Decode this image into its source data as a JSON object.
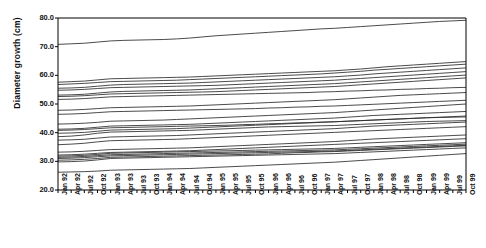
{
  "chart_data": {
    "type": "line",
    "title": "",
    "xlabel": "",
    "ylabel": "Diameter growth (cm)",
    "ylim": [
      20.0,
      80.0
    ],
    "yticks": [
      "20.0",
      "30.0",
      "40.0",
      "50.0",
      "60.0",
      "70.0",
      "80.0"
    ],
    "ytick_values": [
      20.0,
      30.0,
      40.0,
      50.0,
      60.0,
      70.0,
      80.0
    ],
    "grid": false,
    "legend": "none",
    "x": [
      "Jan 92",
      "Apr 92",
      "Jul 92",
      "Oct 92",
      "Jan 93",
      "Apr 93",
      "Jul 93",
      "Oct 93",
      "Jan 94",
      "Apr 94",
      "Jul 94",
      "Oct 94",
      "Jan 95",
      "Apr 95",
      "Jul 95",
      "Oct 95",
      "Jan 96",
      "Apr 96",
      "Jul 96",
      "Oct 96",
      "Jan 97",
      "Apr 97",
      "Jul 97",
      "Oct 97",
      "Jan 98",
      "Apr 98",
      "Jul 98",
      "Oct 98",
      "Jan 99",
      "Apr 99",
      "Jul 99",
      "Oct 99"
    ],
    "series": [
      {
        "name": "tree-01",
        "values": [
          70.8,
          71.0,
          71.2,
          71.6,
          72.0,
          72.2,
          72.3,
          72.4,
          72.5,
          72.7,
          73.0,
          73.4,
          73.8,
          74.1,
          74.4,
          74.7,
          75.0,
          75.3,
          75.6,
          75.9,
          76.2,
          76.4,
          76.7,
          77.0,
          77.3,
          77.6,
          77.9,
          78.2,
          78.5,
          78.8,
          79.0,
          79.2
        ]
      },
      {
        "name": "tree-02",
        "values": [
          57.6,
          57.8,
          58.0,
          58.4,
          58.8,
          58.9,
          59.0,
          59.1,
          59.2,
          59.3,
          59.4,
          59.6,
          59.8,
          60.0,
          60.2,
          60.4,
          60.6,
          60.8,
          61.0,
          61.2,
          61.4,
          61.6,
          61.9,
          62.2,
          62.6,
          63.0,
          63.3,
          63.6,
          63.9,
          64.2,
          64.5,
          64.8
        ]
      },
      {
        "name": "tree-03",
        "values": [
          56.8,
          57.0,
          57.2,
          57.5,
          57.8,
          57.9,
          58.0,
          58.1,
          58.2,
          58.3,
          58.5,
          58.7,
          58.9,
          59.1,
          59.3,
          59.5,
          59.7,
          59.9,
          60.1,
          60.3,
          60.5,
          60.8,
          61.1,
          61.4,
          61.8,
          62.1,
          62.4,
          62.7,
          63.0,
          63.3,
          63.6,
          63.9
        ]
      },
      {
        "name": "tree-04",
        "values": [
          55.5,
          55.6,
          55.8,
          56.2,
          56.6,
          56.8,
          56.9,
          57.0,
          57.1,
          57.2,
          57.3,
          57.5,
          57.7,
          57.9,
          58.1,
          58.3,
          58.5,
          58.7,
          58.9,
          59.1,
          59.3,
          59.5,
          59.8,
          60.1,
          60.5,
          60.8,
          61.1,
          61.4,
          61.7,
          62.0,
          62.3,
          62.6
        ]
      },
      {
        "name": "tree-05",
        "values": [
          54.8,
          54.9,
          55.1,
          55.4,
          55.7,
          55.8,
          55.9,
          56.0,
          56.1,
          56.2,
          56.3,
          56.4,
          56.5,
          56.7,
          56.9,
          57.1,
          57.3,
          57.5,
          57.7,
          57.9,
          58.1,
          58.3,
          58.6,
          58.9,
          59.2,
          59.5,
          59.8,
          60.1,
          60.4,
          60.7,
          61.0,
          61.3
        ]
      },
      {
        "name": "tree-06",
        "values": [
          53.1,
          53.2,
          53.4,
          53.8,
          54.2,
          54.4,
          54.5,
          54.6,
          54.7,
          54.8,
          54.9,
          55.1,
          55.3,
          55.5,
          55.7,
          55.9,
          56.1,
          56.3,
          56.5,
          56.7,
          56.9,
          57.1,
          57.4,
          57.7,
          58.0,
          58.3,
          58.6,
          58.9,
          59.2,
          59.5,
          59.8,
          60.1
        ]
      },
      {
        "name": "tree-07",
        "values": [
          52.6,
          52.7,
          52.9,
          53.2,
          53.5,
          53.6,
          53.7,
          53.8,
          53.9,
          54.0,
          54.1,
          54.2,
          54.3,
          54.5,
          54.7,
          54.9,
          55.1,
          55.3,
          55.5,
          55.7,
          55.9,
          56.1,
          56.4,
          56.7,
          57.0,
          57.3,
          57.6,
          57.9,
          58.2,
          58.5,
          58.8,
          59.1
        ]
      },
      {
        "name": "tree-08",
        "values": [
          51.6,
          51.7,
          51.9,
          52.2,
          52.5,
          52.6,
          52.7,
          52.8,
          52.9,
          53.0,
          53.1,
          53.2,
          53.3,
          53.4,
          53.5,
          53.6,
          53.7,
          53.8,
          53.9,
          54.0,
          54.2,
          54.3,
          54.5,
          54.6,
          54.8,
          54.9,
          55.1,
          55.2,
          55.4,
          55.5,
          55.7,
          55.8
        ]
      },
      {
        "name": "tree-09",
        "values": [
          47.8,
          47.9,
          48.1,
          48.4,
          48.7,
          48.8,
          48.9,
          49.0,
          49.1,
          49.2,
          49.3,
          49.5,
          49.7,
          49.9,
          50.1,
          50.3,
          50.5,
          50.7,
          50.9,
          51.1,
          51.3,
          51.5,
          51.8,
          52.1,
          52.4,
          52.7,
          53.0,
          53.2,
          53.4,
          53.6,
          53.8,
          54.0
        ]
      },
      {
        "name": "tree-10",
        "values": [
          46.4,
          46.5,
          46.7,
          47.0,
          47.3,
          47.4,
          47.5,
          47.6,
          47.7,
          47.8,
          47.9,
          48.0,
          48.1,
          48.2,
          48.3,
          48.4,
          48.6,
          48.7,
          48.9,
          49.0,
          49.2,
          49.3,
          49.5,
          49.7,
          49.9,
          50.1,
          50.3,
          50.5,
          50.7,
          50.9,
          51.1,
          51.3
        ]
      },
      {
        "name": "tree-11",
        "values": [
          43.0,
          43.1,
          43.3,
          43.6,
          44.0,
          44.1,
          44.2,
          44.3,
          44.4,
          44.6,
          44.8,
          45.0,
          45.2,
          45.4,
          45.6,
          45.8,
          46.0,
          46.2,
          46.4,
          46.6,
          46.8,
          47.0,
          47.3,
          47.6,
          47.9,
          48.2,
          48.5,
          48.8,
          49.1,
          49.4,
          49.7,
          50.0
        ]
      },
      {
        "name": "tree-12",
        "values": [
          41.2,
          41.3,
          41.5,
          41.9,
          42.3,
          42.4,
          42.5,
          42.6,
          42.7,
          42.8,
          42.9,
          43.1,
          43.3,
          43.5,
          43.7,
          43.9,
          44.1,
          44.3,
          44.5,
          44.7,
          44.9,
          45.1,
          45.4,
          45.7,
          46.0,
          46.2,
          46.4,
          46.6,
          46.8,
          47.0,
          47.2,
          47.4
        ]
      },
      {
        "name": "tree-13",
        "values": [
          40.8,
          40.9,
          41.1,
          41.4,
          41.7,
          41.8,
          41.9,
          42.0,
          42.1,
          42.2,
          42.3,
          42.4,
          42.5,
          42.6,
          42.8,
          42.9,
          43.1,
          43.2,
          43.4,
          43.5,
          43.7,
          43.8,
          44.0,
          44.2,
          44.4,
          44.6,
          44.8,
          45.0,
          45.2,
          45.4,
          45.6,
          45.8
        ]
      },
      {
        "name": "tree-14",
        "values": [
          39.8,
          39.9,
          40.1,
          40.5,
          40.9,
          41.0,
          41.1,
          41.2,
          41.3,
          41.4,
          41.6,
          41.8,
          42.0,
          42.2,
          42.4,
          42.6,
          42.8,
          43.0,
          43.2,
          43.4,
          43.6,
          43.8,
          44.0,
          44.2,
          44.4,
          44.6,
          44.8,
          45.0,
          45.2,
          45.3,
          45.4,
          45.5
        ]
      },
      {
        "name": "tree-15",
        "values": [
          38.6,
          38.8,
          39.2,
          39.8,
          40.2,
          40.3,
          40.4,
          40.5,
          40.6,
          40.7,
          40.8,
          41.0,
          41.2,
          41.4,
          41.6,
          41.8,
          42.0,
          42.1,
          42.2,
          42.3,
          42.4,
          42.5,
          42.7,
          42.9,
          43.1,
          43.3,
          43.5,
          43.7,
          43.9,
          44.0,
          44.1,
          44.2
        ]
      },
      {
        "name": "tree-16",
        "values": [
          37.4,
          37.5,
          37.7,
          38.1,
          38.5,
          38.6,
          38.7,
          38.8,
          38.9,
          39.0,
          39.2,
          39.4,
          39.6,
          39.8,
          40.0,
          40.2,
          40.4,
          40.6,
          40.8,
          41.0,
          41.2,
          41.4,
          41.7,
          42.0,
          42.3,
          42.5,
          42.7,
          42.9,
          43.1,
          43.3,
          43.5,
          43.7
        ]
      },
      {
        "name": "tree-17",
        "values": [
          35.8,
          36.0,
          36.3,
          36.8,
          37.2,
          37.3,
          37.4,
          37.5,
          37.6,
          37.7,
          37.9,
          38.1,
          38.3,
          38.5,
          38.7,
          38.9,
          39.1,
          39.3,
          39.5,
          39.7,
          39.9,
          40.1,
          40.3,
          40.5,
          40.7,
          40.9,
          41.1,
          41.3,
          41.5,
          41.7,
          41.9,
          42.1
        ]
      },
      {
        "name": "tree-18",
        "values": [
          33.2,
          33.3,
          33.5,
          33.8,
          34.1,
          34.2,
          34.3,
          34.4,
          34.5,
          34.6,
          34.7,
          34.9,
          35.1,
          35.3,
          35.5,
          35.7,
          35.9,
          36.1,
          36.3,
          36.5,
          36.7,
          36.9,
          37.2,
          37.5,
          37.8,
          38.0,
          38.2,
          38.4,
          38.6,
          38.8,
          39.0,
          39.2
        ]
      },
      {
        "name": "tree-19",
        "values": [
          32.2,
          32.3,
          32.5,
          32.8,
          33.1,
          33.2,
          33.3,
          33.4,
          33.5,
          33.6,
          33.7,
          33.9,
          34.1,
          34.3,
          34.5,
          34.7,
          34.9,
          35.1,
          35.3,
          35.5,
          35.7,
          35.9,
          36.1,
          36.3,
          36.5,
          36.7,
          36.9,
          37.1,
          37.3,
          37.5,
          37.7,
          37.9
        ]
      },
      {
        "name": "tree-20",
        "values": [
          31.8,
          31.9,
          32.1,
          32.4,
          32.8,
          32.9,
          33.0,
          33.1,
          33.2,
          33.3,
          33.4,
          33.5,
          33.6,
          33.7,
          33.8,
          33.9,
          34.0,
          34.1,
          34.2,
          34.3,
          34.4,
          34.5,
          34.7,
          34.9,
          35.1,
          35.3,
          35.5,
          35.7,
          35.9,
          36.1,
          36.3,
          36.5
        ]
      },
      {
        "name": "tree-21",
        "values": [
          31.4,
          31.5,
          31.7,
          32.0,
          32.3,
          32.4,
          32.5,
          32.6,
          32.7,
          32.8,
          32.9,
          33.0,
          33.1,
          33.2,
          33.3,
          33.4,
          33.5,
          33.6,
          33.7,
          33.8,
          33.9,
          34.0,
          34.2,
          34.4,
          34.6,
          34.8,
          35.0,
          35.2,
          35.4,
          35.6,
          35.8,
          36.0
        ]
      },
      {
        "name": "tree-22",
        "values": [
          31.0,
          31.1,
          31.3,
          31.6,
          31.9,
          32.0,
          32.1,
          32.2,
          32.3,
          32.4,
          32.5,
          32.6,
          32.7,
          32.8,
          32.9,
          33.0,
          33.1,
          33.2,
          33.3,
          33.4,
          33.5,
          33.6,
          33.8,
          34.0,
          34.2,
          34.4,
          34.6,
          34.8,
          35.0,
          35.2,
          35.4,
          35.6
        ]
      },
      {
        "name": "tree-23",
        "values": [
          30.4,
          30.5,
          30.7,
          31.0,
          31.4,
          31.5,
          31.6,
          31.7,
          31.8,
          31.9,
          32.0,
          32.1,
          32.2,
          32.3,
          32.4,
          32.5,
          32.6,
          32.8,
          33.0,
          33.1,
          33.3,
          33.4,
          33.6,
          33.8,
          34.0,
          34.2,
          34.4,
          34.6,
          34.8,
          35.0,
          35.2,
          35.4
        ]
      },
      {
        "name": "tree-24",
        "values": [
          29.8,
          29.9,
          30.1,
          30.5,
          31.0,
          31.1,
          31.2,
          31.3,
          31.4,
          31.5,
          31.6,
          31.7,
          31.8,
          31.9,
          32.0,
          32.1,
          32.2,
          32.3,
          32.4,
          32.5,
          32.6,
          32.7,
          32.9,
          33.1,
          33.3,
          33.5,
          33.7,
          33.9,
          34.1,
          34.3,
          34.5,
          34.7
        ]
      },
      {
        "name": "tree-25",
        "values": [
          26.2,
          26.3,
          26.4,
          26.6,
          26.9,
          27.0,
          27.1,
          27.2,
          27.3,
          27.4,
          27.5,
          27.7,
          27.9,
          28.1,
          28.3,
          28.5,
          28.7,
          28.9,
          29.1,
          29.3,
          29.5,
          29.7,
          30.0,
          30.3,
          30.6,
          30.9,
          31.2,
          31.5,
          31.8,
          32.1,
          32.4,
          32.7
        ]
      }
    ],
    "line_color": "#2b2b2b",
    "frame_color": "#000000",
    "background_color": "#ffffff"
  }
}
